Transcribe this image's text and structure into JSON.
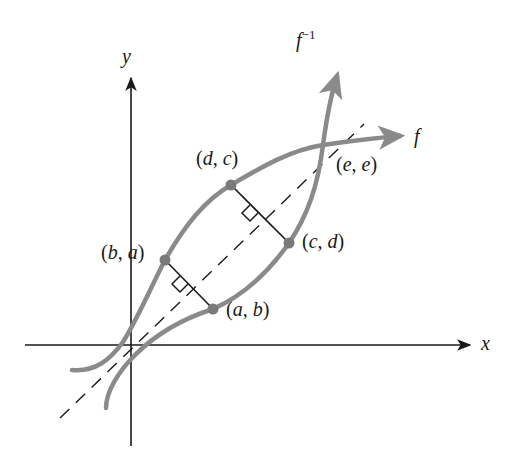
{
  "figure": {
    "colors": {
      "axes": "#1a1a1a",
      "curve": "#8a8a8a",
      "point": "#7a7a7a",
      "dashed_line": "#1a1a1a",
      "segment": "#1a1a1a",
      "text": "#1a1a1a"
    },
    "axes": {
      "x_label": "x",
      "y_label": "y"
    },
    "curves": {
      "f": {
        "label_base": "f",
        "label_sup": ""
      },
      "f_inverse": {
        "label_base": "f",
        "label_sup": "−1"
      }
    },
    "reference_line": {
      "name": "y = x",
      "style": "dashed"
    },
    "points": [
      {
        "id": "b_a",
        "open": "(",
        "a": "b",
        "sep": ", ",
        "b": "a",
        "close": ")"
      },
      {
        "id": "d_c",
        "open": "(",
        "a": "d",
        "sep": ", ",
        "b": "c",
        "close": ")"
      },
      {
        "id": "e_e",
        "open": "(",
        "a": "e",
        "sep": ", ",
        "b": "e",
        "close": ")"
      },
      {
        "id": "c_d",
        "open": "(",
        "a": "c",
        "sep": ", ",
        "b": "d",
        "close": ")"
      },
      {
        "id": "a_b",
        "open": "(",
        "a": "a",
        "sep": ", ",
        "b": "b",
        "close": ")"
      }
    ],
    "perpendiculars": [
      {
        "from": "(b, a)",
        "to": "(a, b)",
        "right_angle_marker": true
      },
      {
        "from": "(d, c)",
        "to": "(c, d)",
        "right_angle_marker": true
      }
    ]
  }
}
